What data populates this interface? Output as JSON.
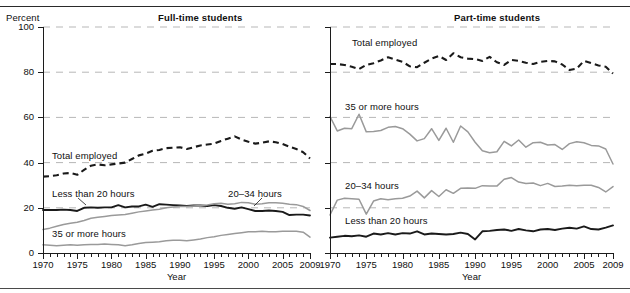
{
  "figure": {
    "y_axis_title": "Percent",
    "x_axis_title": "Year",
    "panels": [
      {
        "key": "full_time",
        "title": "Full-time students"
      },
      {
        "key": "part_time",
        "title": "Part-time students"
      }
    ],
    "y_ticks": [
      "0",
      "20",
      "40",
      "60",
      "80",
      "100"
    ],
    "x_ticks": [
      "1970",
      "1975",
      "1980",
      "1985",
      "1990",
      "1995",
      "2000",
      "2005",
      "2009"
    ]
  },
  "chart_data": {
    "type": "line",
    "xlabel": "Year",
    "ylabel": "Percent",
    "ylim": [
      0,
      100
    ],
    "xlim": [
      1970,
      2009
    ],
    "grid": true,
    "legend": "inline-annotations",
    "x": [
      1970,
      1971,
      1972,
      1973,
      1974,
      1975,
      1976,
      1977,
      1978,
      1979,
      1980,
      1981,
      1982,
      1983,
      1984,
      1985,
      1986,
      1987,
      1988,
      1989,
      1990,
      1991,
      1992,
      1993,
      1994,
      1995,
      1996,
      1997,
      1998,
      1999,
      2000,
      2001,
      2002,
      2003,
      2004,
      2005,
      2006,
      2007,
      2008,
      2009
    ],
    "panels": [
      {
        "name": "Full-time students",
        "series": [
          {
            "name": "Total employed",
            "style": "dashed",
            "color": "#1a1a1a",
            "values": [
              33.8,
              34.0,
              34.4,
              35.2,
              35.4,
              34.6,
              36.8,
              38.6,
              39.2,
              38.8,
              39.2,
              39.6,
              40.0,
              41.6,
              43.2,
              44.0,
              45.2,
              45.6,
              46.4,
              46.6,
              46.8,
              46.0,
              46.8,
              47.6,
              48.0,
              48.4,
              49.6,
              50.6,
              51.6,
              50.2,
              49.2,
              48.4,
              48.8,
              49.4,
              49.0,
              48.2,
              47.0,
              46.0,
              44.6,
              41.8
            ]
          },
          {
            "name": "Less than 20 hours",
            "style": "solid",
            "color": "#1a1a1a",
            "values": [
              19.0,
              19.0,
              19.0,
              19.2,
              19.0,
              18.6,
              20.0,
              20.2,
              20.0,
              20.2,
              20.2,
              21.2,
              20.2,
              20.6,
              20.6,
              21.4,
              20.4,
              21.6,
              21.4,
              21.2,
              21.0,
              20.8,
              21.0,
              21.0,
              20.8,
              21.2,
              20.8,
              20.0,
              19.6,
              20.2,
              19.4,
              18.6,
              18.6,
              18.8,
              18.6,
              18.2,
              16.8,
              17.0,
              17.0,
              16.6
            ]
          },
          {
            "name": "20-34 hours",
            "style": "solid",
            "color": "#9a9a9a",
            "values": [
              10.4,
              11.0,
              11.8,
              12.6,
              13.2,
              13.6,
              14.4,
              15.4,
              15.8,
              16.2,
              16.6,
              16.8,
              17.0,
              17.6,
              18.2,
              18.6,
              19.0,
              19.4,
              20.0,
              20.4,
              20.6,
              20.6,
              20.8,
              21.0,
              21.2,
              21.8,
              22.0,
              21.6,
              21.8,
              22.4,
              22.2,
              21.6,
              21.8,
              22.2,
              22.2,
              22.0,
              21.6,
              21.4,
              20.6,
              18.8
            ]
          },
          {
            "name": "35 or more hours",
            "style": "solid",
            "color": "#9a9a9a",
            "values": [
              3.6,
              3.4,
              3.2,
              3.4,
              3.6,
              3.4,
              3.6,
              3.8,
              3.8,
              4.0,
              3.8,
              3.6,
              3.2,
              3.6,
              4.2,
              4.6,
              4.8,
              5.0,
              5.4,
              5.6,
              5.6,
              5.4,
              5.8,
              6.2,
              6.8,
              7.2,
              7.8,
              8.2,
              8.6,
              9.0,
              9.4,
              9.4,
              9.6,
              9.4,
              9.4,
              9.6,
              9.6,
              9.6,
              9.2,
              7.0
            ]
          }
        ]
      },
      {
        "name": "Part-time students",
        "series": [
          {
            "name": "Total employed",
            "style": "dashed",
            "color": "#1a1a1a",
            "values": [
              83.6,
              83.6,
              83.2,
              82.4,
              81.4,
              83.2,
              84.0,
              85.2,
              86.6,
              85.6,
              84.6,
              82.6,
              82.2,
              84.2,
              86.0,
              87.2,
              85.4,
              88.4,
              86.6,
              86.0,
              85.8,
              85.0,
              86.8,
              84.4,
              83.2,
              85.4,
              85.0,
              84.2,
              83.6,
              84.6,
              85.0,
              84.8,
              83.4,
              81.0,
              81.6,
              85.0,
              84.0,
              83.0,
              82.4,
              79.4
            ]
          },
          {
            "name": "35 or more hours",
            "style": "solid",
            "color": "#9a9a9a",
            "values": [
              60.4,
              54.0,
              55.2,
              55.0,
              61.4,
              53.6,
              53.8,
              54.2,
              55.6,
              56.0,
              55.0,
              52.6,
              49.6,
              50.6,
              55.0,
              49.8,
              55.2,
              49.0,
              56.2,
              53.6,
              49.0,
              45.2,
              44.4,
              44.8,
              49.4,
              47.4,
              50.0,
              46.8,
              48.8,
              49.0,
              47.8,
              48.0,
              45.8,
              48.4,
              49.2,
              48.8,
              47.6,
              47.4,
              46.0,
              39.4
            ]
          },
          {
            "name": "20-34 hours",
            "style": "solid",
            "color": "#9a9a9a",
            "values": [
              16.8,
              23.4,
              24.2,
              24.0,
              23.8,
              17.2,
              23.0,
              24.0,
              23.6,
              24.0,
              24.2,
              25.2,
              27.4,
              24.4,
              27.6,
              25.0,
              28.0,
              26.4,
              28.6,
              28.8,
              28.6,
              29.8,
              29.6,
              29.6,
              32.6,
              33.4,
              31.4,
              30.8,
              31.0,
              29.8,
              30.8,
              29.4,
              29.6,
              30.0,
              29.8,
              30.0,
              30.0,
              29.0,
              27.0,
              29.4
            ]
          },
          {
            "name": "Less than 20 hours",
            "style": "solid",
            "color": "#1a1a1a",
            "values": [
              6.8,
              7.2,
              7.6,
              7.4,
              7.8,
              7.2,
              8.6,
              8.2,
              8.8,
              8.2,
              8.8,
              8.6,
              9.6,
              8.2,
              8.6,
              8.4,
              8.2,
              8.4,
              9.0,
              8.4,
              6.0,
              9.6,
              9.8,
              10.2,
              10.4,
              9.8,
              10.6,
              10.0,
              9.6,
              10.4,
              10.6,
              10.2,
              10.8,
              11.2,
              10.8,
              11.8,
              10.6,
              10.4,
              11.2,
              12.2
            ]
          }
        ]
      }
    ]
  },
  "annotations": {
    "full_time": {
      "total_employed": "Total employed",
      "less_than_20": "Less than 20 hours",
      "hours_20_34": "20–34 hours",
      "hours_35_plus": "35 or more hours"
    },
    "part_time": {
      "total_employed": "Total employed",
      "hours_35_plus": "35 or more hours",
      "hours_20_34": "20–34 hours",
      "less_than_20": "Less than 20 hours"
    }
  }
}
